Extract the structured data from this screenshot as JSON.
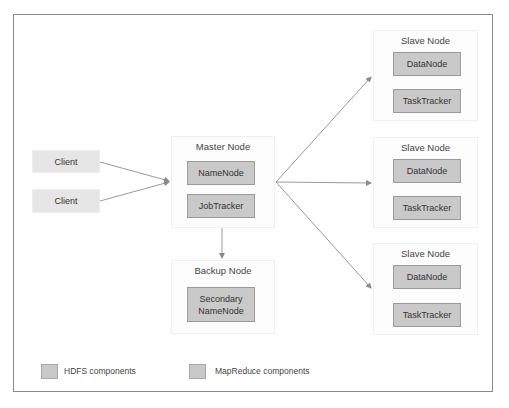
{
  "diagram": {
    "clients": [
      {
        "label": "Client"
      },
      {
        "label": "Client"
      }
    ],
    "master_node": {
      "title": "Master Node",
      "components": [
        {
          "label": "NameNode",
          "type": "HDFS"
        },
        {
          "label": "JobTracker",
          "type": "MapReduce"
        }
      ]
    },
    "backup_node": {
      "title": "Backup Node",
      "components": [
        {
          "label": "Secondary NameNode",
          "type": "HDFS"
        }
      ]
    },
    "slave_nodes": [
      {
        "title": "Slave Node",
        "components": [
          {
            "label": "DataNode",
            "type": "HDFS"
          },
          {
            "label": "TaskTracker",
            "type": "MapReduce"
          }
        ]
      },
      {
        "title": "Slave Node",
        "components": [
          {
            "label": "DataNode",
            "type": "HDFS"
          },
          {
            "label": "TaskTracker",
            "type": "MapReduce"
          }
        ]
      },
      {
        "title": "Slave Node",
        "components": [
          {
            "label": "DataNode",
            "type": "HDFS"
          },
          {
            "label": "TaskTracker",
            "type": "MapReduce"
          }
        ]
      }
    ],
    "edges": [
      {
        "from": "Client 1",
        "to": "Master Node"
      },
      {
        "from": "Client 2",
        "to": "Master Node"
      },
      {
        "from": "Master Node",
        "to": "Backup Node"
      },
      {
        "from": "Master Node",
        "to": "Slave Node 1"
      },
      {
        "from": "Master Node",
        "to": "Slave Node 2"
      },
      {
        "from": "Master Node",
        "to": "Slave Node 3"
      }
    ],
    "legend": [
      {
        "label": "HDFS components",
        "color": "#c9c9c9"
      },
      {
        "label": "MapReduce components",
        "color": "#c9c9c9"
      }
    ]
  }
}
